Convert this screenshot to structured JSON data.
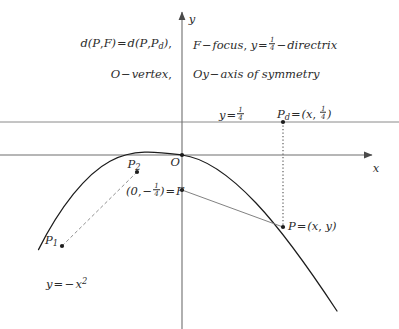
{
  "figure": {
    "title_notes": {
      "line1_left": "d(P,F) = d(P,Pd),",
      "line1_right": "F − focus, y = 1/4 − directrix",
      "line2_left": "O − vertex,",
      "line2_right": "Oy − axis of symmetry"
    },
    "axes": {
      "x_label": "x",
      "y_label": "y",
      "x_axis_y": 155,
      "y_axis_x": 182,
      "origin_label": "O"
    },
    "directrix": {
      "label": "y = 1/4",
      "equation_y": 0.25,
      "line_y_px": 122
    },
    "focus": {
      "label": "(0, −1/4) = F",
      "coords": [
        0,
        -0.25
      ],
      "point_px": [
        182,
        190
      ]
    },
    "points": [
      {
        "name": "P",
        "label": "P = (x, y)",
        "px": [
          283,
          226
        ]
      },
      {
        "name": "Pd",
        "label": "Pd = (x, 1/4)",
        "px": [
          283,
          122
        ]
      },
      {
        "name": "P1",
        "label": "P1",
        "px": [
          62,
          245
        ]
      },
      {
        "name": "P2",
        "label": "P2",
        "px": [
          136,
          170
        ]
      },
      {
        "name": "O",
        "label": "O",
        "px": [
          182,
          155
        ]
      }
    ],
    "curve": {
      "label": "y = −x²",
      "equation": "y = -x^2",
      "vertex_px": [
        182,
        155
      ],
      "scale_px_per_unit": 148
    },
    "colors": {
      "ink": "#2b2b2b",
      "axis": "#6e6e6e",
      "curve": "#1c1c1c",
      "guide": "#6e6e6e",
      "background": "#ffffff"
    }
  }
}
